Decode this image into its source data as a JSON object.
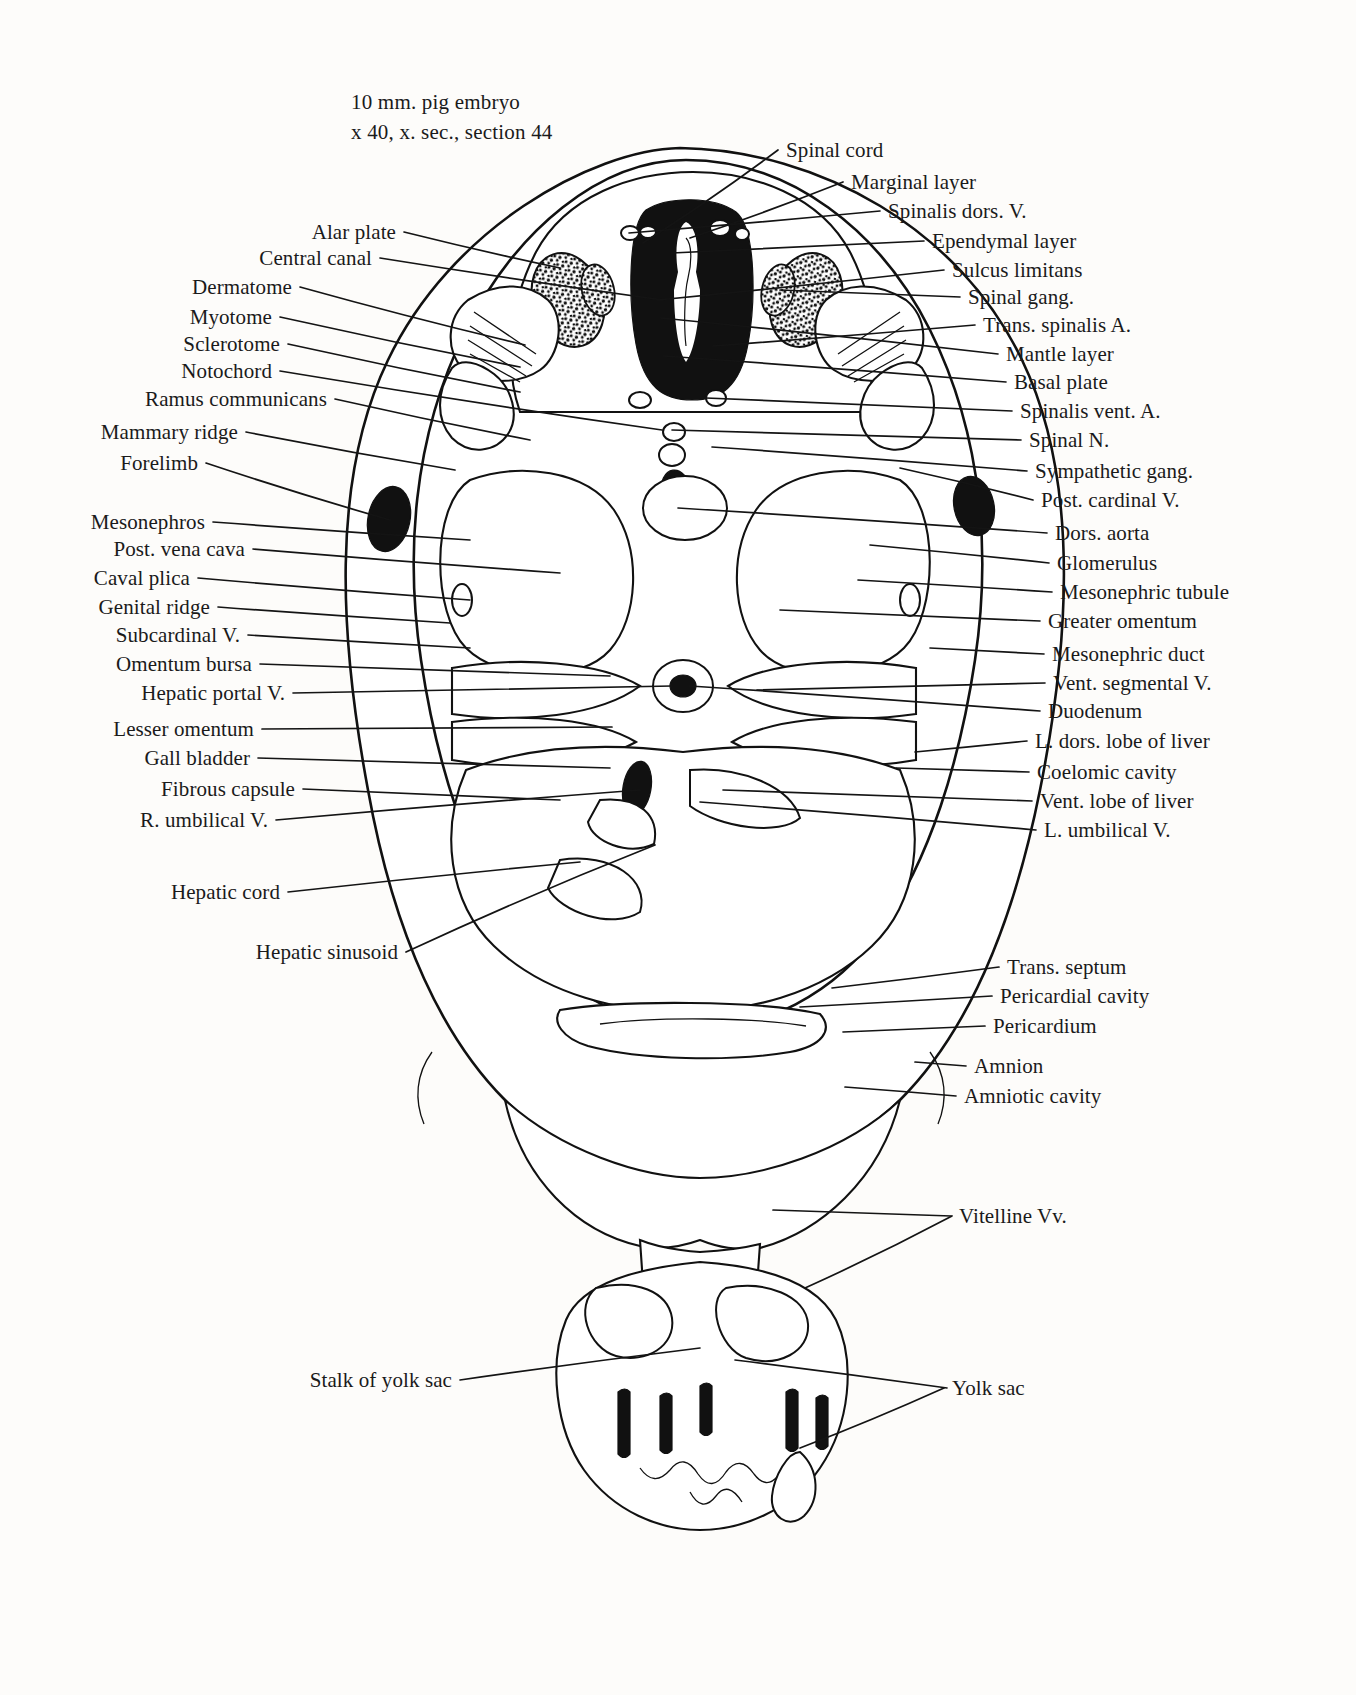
{
  "caption": {
    "line1": "10 mm. pig embryo",
    "line2": "x 40, x. sec., section 44"
  },
  "labels_left": [
    {
      "text": "Alar plate",
      "x": 396,
      "y": 232,
      "tx": 560,
      "ty": 268
    },
    {
      "text": "Central canal",
      "x": 372,
      "y": 258,
      "tx": 663,
      "ty": 300
    },
    {
      "text": "Dermatome",
      "x": 292,
      "y": 287,
      "tx": 525,
      "ty": 345
    },
    {
      "text": "Myotome",
      "x": 272,
      "y": 317,
      "tx": 520,
      "ty": 367
    },
    {
      "text": "Sclerotome",
      "x": 280,
      "y": 344,
      "tx": 520,
      "ty": 392
    },
    {
      "text": "Notochord",
      "x": 272,
      "y": 371,
      "tx": 662,
      "ty": 430
    },
    {
      "text": "Ramus communicans",
      "x": 327,
      "y": 399,
      "tx": 530,
      "ty": 440
    },
    {
      "text": "Mammary ridge",
      "x": 238,
      "y": 432,
      "tx": 455,
      "ty": 470
    },
    {
      "text": "Forelimb",
      "x": 198,
      "y": 463,
      "tx": 390,
      "ty": 520
    },
    {
      "text": "Mesonephros",
      "x": 205,
      "y": 522,
      "tx": 470,
      "ty": 540
    },
    {
      "text": "Post. vena cava",
      "x": 245,
      "y": 549,
      "tx": 560,
      "ty": 573
    },
    {
      "text": "Caval plica",
      "x": 190,
      "y": 578,
      "tx": 470,
      "ty": 600
    },
    {
      "text": "Genital ridge",
      "x": 210,
      "y": 607,
      "tx": 450,
      "ty": 623
    },
    {
      "text": "Subcardinal V.",
      "x": 240,
      "y": 635,
      "tx": 470,
      "ty": 648
    },
    {
      "text": "Omentum bursa",
      "x": 252,
      "y": 664,
      "tx": 610,
      "ty": 676
    },
    {
      "text": "Hepatic portal V.",
      "x": 285,
      "y": 693,
      "tx": 672,
      "ty": 686
    },
    {
      "text": "Lesser omentum",
      "x": 254,
      "y": 729,
      "tx": 612,
      "ty": 727
    },
    {
      "text": "Gall bladder",
      "x": 250,
      "y": 758,
      "tx": 610,
      "ty": 768
    },
    {
      "text": "Fibrous capsule",
      "x": 295,
      "y": 789,
      "tx": 560,
      "ty": 800
    },
    {
      "text": "R. umbilical V.",
      "x": 268,
      "y": 820,
      "tx": 640,
      "ty": 790
    },
    {
      "text": "Hepatic cord",
      "x": 280,
      "y": 892,
      "tx": 580,
      "ty": 862
    },
    {
      "text": "Hepatic sinusoid",
      "x": 398,
      "y": 952,
      "tx": 655,
      "ty": 845
    },
    {
      "text": "Stalk of yolk sac",
      "x": 452,
      "y": 1380,
      "tx": 700,
      "ty": 1348
    }
  ],
  "labels_right": [
    {
      "text": "Spinal cord",
      "x": 786,
      "y": 150,
      "tx": 643,
      "ty": 243
    },
    {
      "text": "Marginal layer",
      "x": 851,
      "y": 182,
      "tx": 690,
      "ty": 238
    },
    {
      "text": "Spinalis dors. V.",
      "x": 888,
      "y": 211,
      "tx": 629,
      "ty": 233
    },
    {
      "text": "Ependymal layer",
      "x": 932,
      "y": 241,
      "tx": 672,
      "ty": 253
    },
    {
      "text": "Sulcus limitans",
      "x": 952,
      "y": 270,
      "tx": 658,
      "ty": 300
    },
    {
      "text": "Spinal gang.",
      "x": 968,
      "y": 297,
      "tx": 780,
      "ty": 290
    },
    {
      "text": "Trans. spinalis A.",
      "x": 983,
      "y": 325,
      "tx": 713,
      "ty": 346
    },
    {
      "text": "Mantle layer",
      "x": 1006,
      "y": 354,
      "tx": 661,
      "ty": 318
    },
    {
      "text": "Basal plate",
      "x": 1014,
      "y": 382,
      "tx": 664,
      "ty": 356
    },
    {
      "text": "Spinalis vent. A.",
      "x": 1020,
      "y": 411,
      "tx": 706,
      "ty": 398
    },
    {
      "text": "Spinal N.",
      "x": 1029,
      "y": 440,
      "tx": 672,
      "ty": 430
    },
    {
      "text": "Sympathetic gang.",
      "x": 1035,
      "y": 471,
      "tx": 712,
      "ty": 447
    },
    {
      "text": "Post. cardinal V.",
      "x": 1041,
      "y": 500,
      "tx": 900,
      "ty": 468
    },
    {
      "text": "Dors. aorta",
      "x": 1055,
      "y": 533,
      "tx": 678,
      "ty": 508
    },
    {
      "text": "Glomerulus",
      "x": 1057,
      "y": 563,
      "tx": 870,
      "ty": 545
    },
    {
      "text": "Mesonephric tubule",
      "x": 1060,
      "y": 592,
      "tx": 858,
      "ty": 580
    },
    {
      "text": "Greater omentum",
      "x": 1048,
      "y": 621,
      "tx": 780,
      "ty": 610
    },
    {
      "text": "Mesonephric duct",
      "x": 1052,
      "y": 654,
      "tx": 930,
      "ty": 648
    },
    {
      "text": "Vent. segmental V.",
      "x": 1053,
      "y": 683,
      "tx": 757,
      "ty": 690
    },
    {
      "text": "Duodenum",
      "x": 1048,
      "y": 711,
      "tx": 690,
      "ty": 686
    },
    {
      "text": "L. dors. lobe of  liver",
      "x": 1035,
      "y": 741,
      "tx": 915,
      "ty": 752
    },
    {
      "text": "Coelomic cavity",
      "x": 1037,
      "y": 772,
      "tx": 896,
      "ty": 768
    },
    {
      "text": "Vent. lobe of liver",
      "x": 1040,
      "y": 801,
      "tx": 723,
      "ty": 790
    },
    {
      "text": "L. umbilical V.",
      "x": 1044,
      "y": 830,
      "tx": 700,
      "ty": 802
    },
    {
      "text": "Trans. septum",
      "x": 1007,
      "y": 967,
      "tx": 832,
      "ty": 988
    },
    {
      "text": "Pericardial cavity",
      "x": 1000,
      "y": 996,
      "tx": 800,
      "ty": 1007
    },
    {
      "text": "Pericardium",
      "x": 993,
      "y": 1026,
      "tx": 843,
      "ty": 1032
    },
    {
      "text": "Amnion",
      "x": 974,
      "y": 1066,
      "tx": 915,
      "ty": 1062
    },
    {
      "text": "Amniotic cavity",
      "x": 964,
      "y": 1096,
      "tx": 845,
      "ty": 1087
    },
    {
      "text": "Vitelline Vv.",
      "x": 959,
      "y": 1216,
      "tx": 773,
      "ty": 1210
    },
    {
      "text": "Yolk sac",
      "x": 952,
      "y": 1388,
      "tx": 800,
      "ty": 1448
    }
  ],
  "extra_leaders": [
    {
      "fx": 952,
      "fy": 1216,
      "tx": 805,
      "ty": 1288
    },
    {
      "fx": 947,
      "fy": 1388,
      "tx": 735,
      "ty": 1360
    }
  ],
  "colors": {
    "ink": "#111111",
    "paper": "#fdfcfa"
  }
}
